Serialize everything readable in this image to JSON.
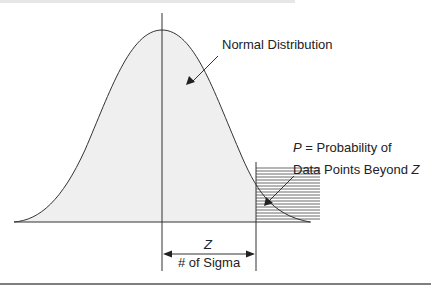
{
  "figure": {
    "curve_label": "Normal Distribution",
    "tail_label_line1_var": "P",
    "tail_label_line1_rest": " = Probability of",
    "tail_label_line2_text": "Data Points Beyond ",
    "tail_label_line2_var": "Z",
    "z_label": "Z",
    "sigma_label": "# of Sigma"
  },
  "colors": {
    "line": "#333333",
    "fill": "#efefef",
    "hatch": "#444444"
  }
}
